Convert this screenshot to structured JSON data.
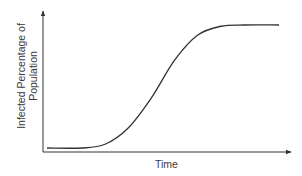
{
  "chart_data": {
    "type": "line",
    "title": "",
    "xlabel": "Time",
    "ylabel_lines": [
      "Infected Percentage of",
      "Population"
    ],
    "ylabel": "Infected Percentage of Population",
    "grid": false,
    "legend": null,
    "axis_ticks": "none",
    "series": [
      {
        "name": "Infected Percentage of Population",
        "color": "#333333",
        "x": [
          0,
          0.15,
          0.25,
          0.35,
          0.45,
          0.55,
          0.65,
          0.75,
          0.85,
          1.0
        ],
        "y": [
          0.02,
          0.02,
          0.05,
          0.18,
          0.42,
          0.72,
          0.92,
          0.99,
          1.0,
          1.0
        ]
      }
    ]
  },
  "colors": {
    "axis": "#333333",
    "curve": "#333333",
    "text": "#3a3a3a"
  }
}
